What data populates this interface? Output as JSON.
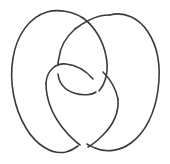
{
  "figure": {
    "name": "knot-diagram",
    "type": "line-drawing",
    "title": "",
    "background_color": "#ffffff",
    "stroke_color": "#3b3b3b",
    "stroke_width": 1.6,
    "width": 170,
    "height": 164,
    "crossing_count": 4,
    "crossings": [
      {
        "name": "top-crossing",
        "x": 80,
        "y": 20,
        "over": "left-lobe-top-arc",
        "under": "central-loop-rising-strand"
      },
      {
        "name": "upper-left-crossing",
        "x": 64,
        "y": 69,
        "over": "heart-top-left-arc",
        "under": "central-loop-descending-strand"
      },
      {
        "name": "upper-right-crossing",
        "x": 99,
        "y": 75,
        "over": "central-loop-right-strand",
        "under": "heart-top-right-arc"
      },
      {
        "name": "bottom-crossing",
        "x": 83,
        "y": 142,
        "over": "right-lobe-bottom-arc",
        "under": "left-lobe-bottom-arc"
      }
    ],
    "strokes": [
      {
        "name": "left-outer-lobe",
        "d": "M 83 18 C 72 11, 58 9, 47 12 C 30 17, 17 34, 13 58 C 9 82, 14 108, 26 128 C 36 145, 52 155, 66 152 C 70 151, 74 149, 78 146"
      },
      {
        "name": "right-outer-lobe",
        "d": "M 110 15 C 124 11, 139 18, 148 32 C 158 47, 161 68, 158 90 C 155 113, 145 133, 131 143 C 120 151, 106 153, 95 148 C 92 147, 89 145, 87 144"
      },
      {
        "name": "central-loop-rising-strand",
        "d": "M 75 29 C 83 23, 92 18, 100 16 C 104 15, 107 15, 110 15"
      },
      {
        "name": "central-loop-descending-strand",
        "d": "M 83 18 C 94 26, 103 40, 106 56 C 109 70, 106 83, 99 91"
      },
      {
        "name": "central-loop-left-side",
        "d": "M 75 29 C 66 37, 60 48, 59 58 C 58 61, 58 64, 58 65"
      },
      {
        "name": "central-loop-bottom-arc",
        "d": "M 58 74 C 59 83, 65 90, 74 93 C 83 96, 92 95, 96 92"
      },
      {
        "name": "heart-top-left-arc",
        "d": "M 46 83 C 47 70, 56 63, 66 64 C 77 65, 87 72, 93 79"
      },
      {
        "name": "heart-top-right-arc",
        "d": "M 103 72 C 110 79, 116 89, 118 99"
      },
      {
        "name": "heart-left-lower-arc",
        "d": "M 46 83 C 46 98, 52 114, 62 127 C 69 136, 76 142, 80 145"
      },
      {
        "name": "heart-right-lower-arc",
        "d": "M 118 99 C 119 112, 113 125, 103 135 C 97 141, 92 145, 88 147"
      }
    ]
  }
}
